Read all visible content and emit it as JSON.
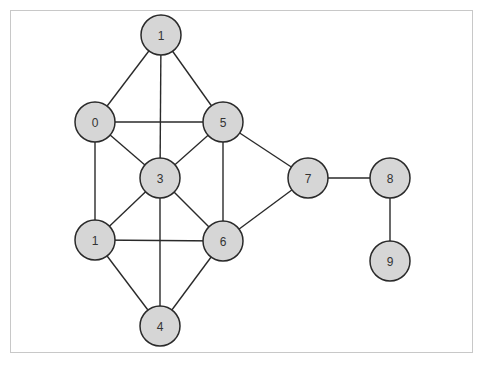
{
  "diagram": {
    "type": "undirected-graph",
    "colors": {
      "node_fill": "#d6d6d6",
      "node_stroke": "#2a2a2a",
      "edge": "#2a2a2a",
      "frame": "#c8c8c8",
      "label": "#333333"
    },
    "node_radius": 20,
    "nodes": [
      {
        "id": "n_top1",
        "label": "1",
        "x": 161,
        "y": 35
      },
      {
        "id": "n0",
        "label": "0",
        "x": 95,
        "y": 122
      },
      {
        "id": "n5",
        "label": "5",
        "x": 223,
        "y": 122
      },
      {
        "id": "n3",
        "label": "3",
        "x": 160,
        "y": 178
      },
      {
        "id": "n_low1",
        "label": "1",
        "x": 95,
        "y": 240
      },
      {
        "id": "n6",
        "label": "6",
        "x": 223,
        "y": 241
      },
      {
        "id": "n4",
        "label": "4",
        "x": 160,
        "y": 326
      },
      {
        "id": "n7",
        "label": "7",
        "x": 308,
        "y": 178
      },
      {
        "id": "n8",
        "label": "8",
        "x": 390,
        "y": 178
      },
      {
        "id": "n9",
        "label": "9",
        "x": 390,
        "y": 261
      }
    ],
    "edges": [
      [
        "n_top1",
        "n0"
      ],
      [
        "n_top1",
        "n5"
      ],
      [
        "n_top1",
        "n3"
      ],
      [
        "n0",
        "n5"
      ],
      [
        "n0",
        "n3"
      ],
      [
        "n0",
        "n_low1"
      ],
      [
        "n5",
        "n3"
      ],
      [
        "n5",
        "n6"
      ],
      [
        "n5",
        "n7"
      ],
      [
        "n3",
        "n_low1"
      ],
      [
        "n3",
        "n6"
      ],
      [
        "n3",
        "n4"
      ],
      [
        "n_low1",
        "n6"
      ],
      [
        "n_low1",
        "n4"
      ],
      [
        "n6",
        "n4"
      ],
      [
        "n6",
        "n7"
      ],
      [
        "n7",
        "n8"
      ],
      [
        "n8",
        "n9"
      ]
    ]
  }
}
